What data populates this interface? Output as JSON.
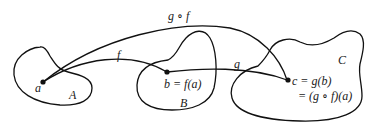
{
  "diagram": {
    "sets": [
      {
        "id": "A",
        "label": "A"
      },
      {
        "id": "B",
        "label": "B"
      },
      {
        "id": "C",
        "label": "C"
      }
    ],
    "points": [
      {
        "id": "a",
        "label": "a"
      },
      {
        "id": "b",
        "label": "b = f(a)"
      },
      {
        "id": "c",
        "label": "c = g(b)",
        "label2": "= (g ∘ f)(a)"
      }
    ],
    "arrows": [
      {
        "id": "f",
        "from": "a",
        "to": "b",
        "label": "f"
      },
      {
        "id": "g",
        "from": "b",
        "to": "c",
        "label": "g"
      },
      {
        "id": "gof",
        "from": "a",
        "to": "c",
        "label": "g ∘ f"
      }
    ],
    "colors": {
      "stroke": "#111111",
      "background": "#ffffff"
    }
  }
}
